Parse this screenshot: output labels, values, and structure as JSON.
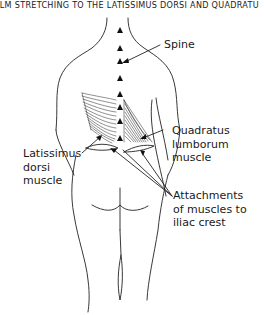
{
  "figure": {
    "title": "ALM STRETCHING TO THE LATISSIMUS DORSI AND QUADRATU",
    "line_color": "#222222",
    "labels": {
      "spine": "Spine",
      "quadratus": [
        "Quadratus",
        "lumborum",
        "muscle"
      ],
      "latissimus": [
        "Latissimus",
        "dorsi",
        "muscle"
      ],
      "attachments": [
        "Attachments",
        "of muscles to",
        "iliac crest"
      ]
    }
  }
}
